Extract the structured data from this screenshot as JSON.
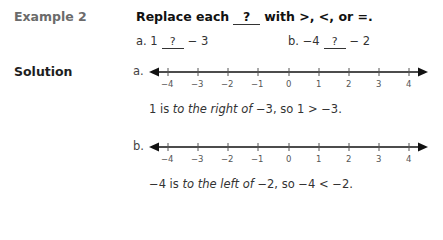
{
  "example": {
    "label": "Example 2",
    "instruction_pre": "Replace each",
    "blank_symbol": "?",
    "instruction_post": "with >, <, or =.",
    "parts": [
      {
        "letter": "a.",
        "left": "1",
        "blank": "?",
        "right": "− 3"
      },
      {
        "letter": "b.",
        "left": "−4",
        "blank": "?",
        "right": "− 2"
      }
    ]
  },
  "solution": {
    "label": "Solution",
    "number_lines": [
      {
        "letter": "a.",
        "ticks": [
          "−4",
          "−3",
          "−2",
          "−1",
          "0",
          "1",
          "2",
          "3",
          "4"
        ]
      },
      {
        "letter": "b.",
        "ticks": [
          "−4",
          "−3",
          "−2",
          "−1",
          "0",
          "1",
          "2",
          "3",
          "4"
        ]
      }
    ],
    "statements": [
      {
        "start": "1 is",
        "italic": "to the right of",
        "end": "−3, so 1 > −3."
      },
      {
        "start": "−4 is",
        "italic": "to the left of",
        "end": "−2, so −4 < −2."
      }
    ]
  },
  "colors": {
    "line": "#111111",
    "tick_label": "#555555"
  }
}
